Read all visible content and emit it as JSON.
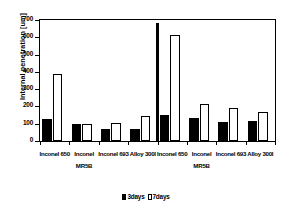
{
  "chart_data": {
    "type": "bar",
    "title": "",
    "xlabel": "",
    "ylabel": "Internal penetration [um]",
    "ylim": [
      0,
      700
    ],
    "yticks": [
      0,
      100,
      200,
      300,
      400,
      500,
      600,
      700
    ],
    "ytick_labels": [
      "0",
      "100",
      "200",
      "300",
      "400",
      "500",
      "600",
      "700"
    ],
    "grid": false,
    "legend_position": "bottom-center",
    "categories": [
      "Inconel 650",
      "Inconel",
      "Inconel 693",
      "Alloy 300I",
      "Inconel 650",
      "Inconel",
      "Inconel 693",
      "Alloy 300I"
    ],
    "group_labels": [
      "MR5B",
      "MR5B"
    ],
    "series": [
      {
        "name": "3days",
        "color": "#000000",
        "fill": "solid",
        "values": [
          125,
          98,
          72,
          72,
          148,
          133,
          108,
          115
        ]
      },
      {
        "name": "7days",
        "color": "#ffffff",
        "fill": "hollow",
        "values": [
          385,
          97,
          105,
          145,
          615,
          215,
          190,
          165
        ]
      }
    ],
    "annotations": [
      {
        "name": "group-divider",
        "type": "vertical-line",
        "value": 680,
        "position_between_categories": [
          4,
          5
        ]
      }
    ]
  },
  "legend": {
    "items": [
      {
        "label": "3days",
        "swatch": "filled"
      },
      {
        "label": "7days",
        "swatch": "hollow"
      }
    ]
  },
  "axis": {
    "y_title": "Internal penetration [um]"
  }
}
